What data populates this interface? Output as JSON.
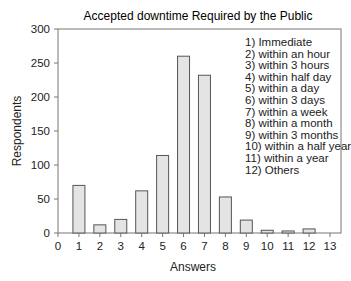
{
  "chart_data": {
    "type": "bar",
    "title": "Accepted downtime Required by the Public",
    "xlabel": "Answers",
    "ylabel": "Respondents",
    "categories": [
      "1",
      "2",
      "3",
      "4",
      "5",
      "6",
      "7",
      "8",
      "9",
      "10",
      "11",
      "12"
    ],
    "values": [
      70,
      12,
      20,
      62,
      114,
      260,
      232,
      53,
      19,
      4,
      3,
      6
    ],
    "xlim": [
      0,
      13
    ],
    "ylim": [
      0,
      300
    ],
    "xticks": [
      "0",
      "1",
      "2",
      "3",
      "4",
      "5",
      "6",
      "7",
      "8",
      "9",
      "10",
      "11",
      "12",
      "13"
    ],
    "yticks": [
      "0",
      "50",
      "100",
      "150",
      "200",
      "250",
      "300"
    ],
    "grid": false,
    "legend_position": "upper right (inside)",
    "legend": [
      "1)  Immediate",
      "2)  within an hour",
      "3)  within 3 hours",
      "4)  within half day",
      "5)  within a day",
      "6)  within 3 days",
      "7)  within a week",
      "8)  within a month",
      "9)  within 3 months",
      "10) within a half year",
      "11) within a year",
      "12) Others"
    ],
    "colors": {
      "bar_fill": "#e4e4e4",
      "bar_stroke": "#555555",
      "axis": "#777777"
    }
  }
}
